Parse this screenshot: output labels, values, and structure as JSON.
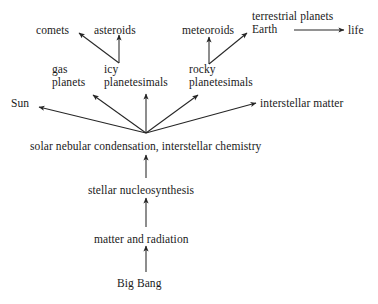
{
  "diagram": {
    "background_color": "#ffffff",
    "line_color": "#262626",
    "text_color": "#1a1a1a",
    "nodes": [
      {
        "id": "comets",
        "label": "comets",
        "lines": [
          "comets"
        ],
        "x": 36,
        "y": 24
      },
      {
        "id": "asteroids",
        "label": "asteroids",
        "lines": [
          "asteroids"
        ],
        "x": 94,
        "y": 24
      },
      {
        "id": "meteoroids",
        "label": "meteoroids",
        "lines": [
          "meteoroids"
        ],
        "x": 182,
        "y": 24
      },
      {
        "id": "terrestrial-planets-earth",
        "label": "terrestrial planets Earth",
        "lines": [
          "terrestrial planets",
          "Earth"
        ],
        "x": 252,
        "y": 10
      },
      {
        "id": "life",
        "label": "life",
        "lines": [
          "life"
        ],
        "x": 348,
        "y": 24
      },
      {
        "id": "gas-planets",
        "label": "gas planets",
        "lines": [
          "gas",
          "planets"
        ],
        "x": 52,
        "y": 63
      },
      {
        "id": "icy-planetesimals",
        "label": "icy planetesimals",
        "lines": [
          "icy",
          "planetesimals"
        ],
        "x": 104,
        "y": 63
      },
      {
        "id": "rocky-planetesimals",
        "label": "rocky planetesimals",
        "lines": [
          "rocky",
          "planetesimals"
        ],
        "x": 189,
        "y": 63
      },
      {
        "id": "sun",
        "label": "Sun",
        "lines": [
          "Sun"
        ],
        "x": 11,
        "y": 97
      },
      {
        "id": "interstellar-matter",
        "label": "interstellar matter",
        "lines": [
          "interstellar matter"
        ],
        "x": 260,
        "y": 97
      },
      {
        "id": "solar-nebular-condensation",
        "label": "solar nebular condensation,  interstellar chemistry",
        "lines": [
          "solar nebular condensation,  interstellar chemistry"
        ],
        "x": 30,
        "y": 140
      },
      {
        "id": "stellar-nucleosynthesis",
        "label": "stellar nucleosynthesis",
        "lines": [
          "stellar nucleosynthesis"
        ],
        "x": 88,
        "y": 184
      },
      {
        "id": "matter-and-radiation",
        "label": "matter and radiation",
        "lines": [
          "matter and radiation"
        ],
        "x": 94,
        "y": 233
      },
      {
        "id": "big-bang",
        "label": "Big Bang",
        "lines": [
          "Big Bang"
        ],
        "x": 117,
        "y": 277
      }
    ],
    "edges": [
      {
        "id": "big-bang-to-matter",
        "from": "Big Bang",
        "to": "matter and radiation",
        "x1": 146,
        "y1": 272,
        "x2": 146,
        "y2": 246
      },
      {
        "id": "matter-to-nucleosynthesis",
        "from": "matter and radiation",
        "to": "stellar nucleosynthesis",
        "x1": 146,
        "y1": 227,
        "x2": 146,
        "y2": 198
      },
      {
        "id": "nucleosynthesis-to-nebular",
        "from": "stellar nucleosynthesis",
        "to": "solar nebular condensation",
        "x1": 146,
        "y1": 178,
        "x2": 146,
        "y2": 155
      },
      {
        "id": "nebular-to-sun",
        "from": "solar nebular condensation",
        "to": "Sun",
        "x1": 146,
        "y1": 133,
        "x2": 39,
        "y2": 107
      },
      {
        "id": "nebular-to-gas-planets",
        "from": "solar nebular condensation",
        "to": "gas planets",
        "x1": 146,
        "y1": 133,
        "x2": 93,
        "y2": 95
      },
      {
        "id": "nebular-to-icy",
        "from": "solar nebular condensation",
        "to": "icy planetesimals",
        "x1": 146,
        "y1": 133,
        "x2": 146,
        "y2": 94
      },
      {
        "id": "nebular-to-rocky",
        "from": "solar nebular condensation",
        "to": "rocky planetesimals",
        "x1": 146,
        "y1": 133,
        "x2": 198,
        "y2": 95
      },
      {
        "id": "nebular-to-interstellar",
        "from": "solar nebular condensation",
        "to": "interstellar matter",
        "x1": 146,
        "y1": 133,
        "x2": 256,
        "y2": 103
      },
      {
        "id": "icy-to-asteroids",
        "from": "icy planetesimals",
        "to": "asteroids",
        "x1": 119,
        "y1": 63,
        "x2": 119,
        "y2": 35
      },
      {
        "id": "icy-to-comets",
        "from": "icy planetesimals",
        "to": "comets",
        "x1": 119,
        "y1": 63,
        "x2": 79,
        "y2": 33
      },
      {
        "id": "rocky-to-meteoroids",
        "from": "rocky planetesimals",
        "to": "meteoroids",
        "x1": 209,
        "y1": 64,
        "x2": 209,
        "y2": 37
      },
      {
        "id": "rocky-to-earth",
        "from": "rocky planetesimals",
        "to": "terrestrial planets Earth",
        "x1": 209,
        "y1": 64,
        "x2": 247,
        "y2": 33
      },
      {
        "id": "earth-to-life",
        "from": "Earth",
        "to": "life",
        "x1": 294,
        "y1": 30,
        "x2": 344,
        "y2": 30
      }
    ]
  }
}
